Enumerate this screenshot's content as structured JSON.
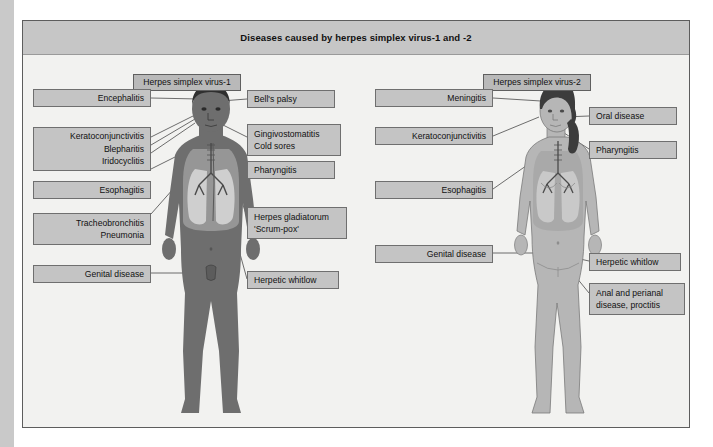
{
  "title": "Diseases caused by herpes simplex virus-1 and -2",
  "figures": {
    "left": {
      "header": "Herpes simplex virus-1",
      "sex": "male"
    },
    "right": {
      "header": "Herpes simplex virus-2",
      "sex": "female"
    }
  },
  "labels_hsv1_left": [
    {
      "lines": [
        "Encephalitis"
      ]
    },
    {
      "lines": [
        "Keratoconjunctivitis",
        "Blepharitis",
        "Iridocyclitis"
      ]
    },
    {
      "lines": [
        "Esophagitis"
      ]
    },
    {
      "lines": [
        "Tracheobronchitis",
        "Pneumonia"
      ]
    },
    {
      "lines": [
        "Genital disease"
      ]
    }
  ],
  "labels_hsv1_right": [
    {
      "lines": [
        "Bell's palsy"
      ]
    },
    {
      "lines": [
        "Gingivostomatitis",
        "Cold sores"
      ]
    },
    {
      "lines": [
        "Pharyngitis"
      ]
    },
    {
      "lines": [
        "Herpes gladiatorum",
        "'Scrum-pox'"
      ]
    },
    {
      "lines": [
        "Herpetic whitlow"
      ]
    }
  ],
  "labels_hsv2_left": [
    {
      "lines": [
        "Meningitis"
      ]
    },
    {
      "lines": [
        "Keratoconjunctivitis"
      ]
    },
    {
      "lines": [
        "Esophagitis"
      ]
    },
    {
      "lines": [
        "Genital disease"
      ]
    }
  ],
  "labels_hsv2_right": [
    {
      "lines": [
        "Oral disease"
      ]
    },
    {
      "lines": [
        "Pharyngitis"
      ]
    },
    {
      "lines": [
        "Herpetic whitlow"
      ]
    },
    {
      "lines": [
        "Anal and perianal",
        "disease, proctitis"
      ]
    }
  ],
  "colors": {
    "panel_bg": "#f2f2f0",
    "title_bg": "#c6c6c6",
    "box_bg": "#c4c4c4",
    "box_border": "#6f6f6f",
    "male_body": "#6e6e6e",
    "female_body": "#b6b6b6",
    "hair_dark": "#3a3a3a",
    "lung_fill": "#cfcfcf",
    "line": "#4a4a4a"
  }
}
